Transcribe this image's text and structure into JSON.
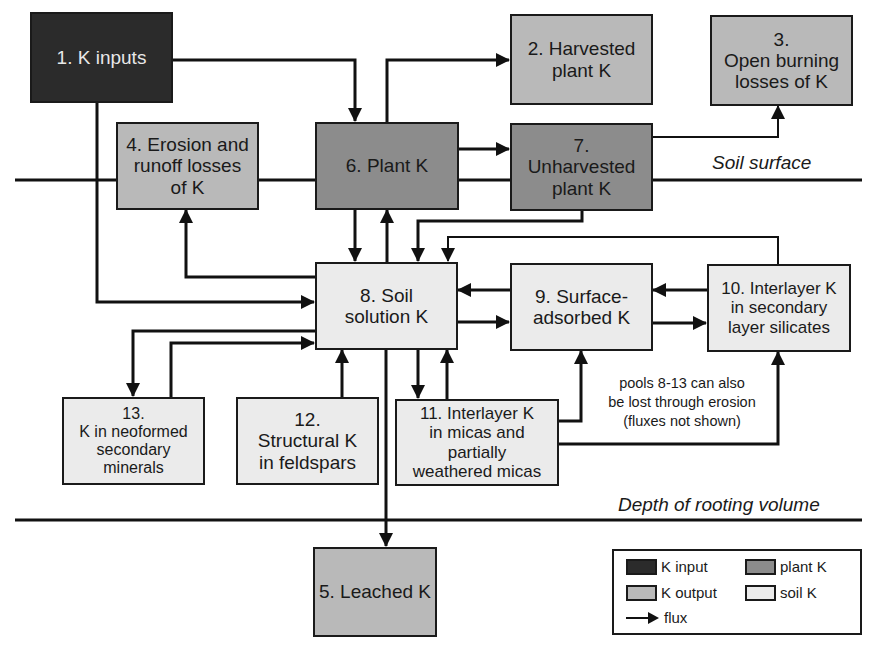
{
  "diagram": {
    "boundaries": {
      "soil_surface": "Soil surface",
      "rooting_depth": "Depth of rooting volume"
    },
    "pools": [
      {
        "id": 1,
        "label": "1. K inputs",
        "category": "K input"
      },
      {
        "id": 2,
        "label": "2. Harvested\nplant K",
        "category": "K output"
      },
      {
        "id": 3,
        "label": "3.\nOpen burning\nlosses of  K",
        "category": "K output"
      },
      {
        "id": 4,
        "label": "4. Erosion and\nrunoff losses\nof K",
        "category": "K output"
      },
      {
        "id": 5,
        "label": "5. Leached K",
        "category": "K output"
      },
      {
        "id": 6,
        "label": "6. Plant K",
        "category": "plant K"
      },
      {
        "id": 7,
        "label": "7.\nUnharvested\nplant K",
        "category": "plant K"
      },
      {
        "id": 8,
        "label": "8. Soil\nsolution K",
        "category": "soil K"
      },
      {
        "id": 9,
        "label": "9. Surface-\nadsorbed K",
        "category": "soil K"
      },
      {
        "id": 10,
        "label": "10. Interlayer K\nin secondary\nlayer silicates",
        "category": "soil K"
      },
      {
        "id": 11,
        "label": "11. Interlayer K\nin micas and\npartially\nweathered micas",
        "category": "soil K"
      },
      {
        "id": 12,
        "label": "12.\nStructural K\nin feldspars",
        "category": "soil K"
      },
      {
        "id": 13,
        "label": "13.\nK in neoformed\nsecondary\nminerals",
        "category": "soil K"
      }
    ],
    "fluxes": [
      {
        "from": 1,
        "to": 6
      },
      {
        "from": 1,
        "to": 8
      },
      {
        "from": 6,
        "to": 2
      },
      {
        "from": 6,
        "to": 7
      },
      {
        "from": 7,
        "to": 3
      },
      {
        "from": 6,
        "to": 8
      },
      {
        "from": 8,
        "to": 6
      },
      {
        "from": 7,
        "to": 8
      },
      {
        "from": 8,
        "to": 4
      },
      {
        "from": 8,
        "to": 9
      },
      {
        "from": 9,
        "to": 8
      },
      {
        "from": 9,
        "to": 10
      },
      {
        "from": 10,
        "to": 9
      },
      {
        "from": 10,
        "to": 8
      },
      {
        "from": 8,
        "to": 13
      },
      {
        "from": 13,
        "to": 8
      },
      {
        "from": 12,
        "to": 8
      },
      {
        "from": 8,
        "to": 11
      },
      {
        "from": 11,
        "to": 8
      },
      {
        "from": 11,
        "to": 9
      },
      {
        "from": 11,
        "to": 10
      },
      {
        "from": 8,
        "to": 5
      }
    ],
    "note": "pools 8-13 can also\nbe lost through erosion\n(fluxes not shown)",
    "legend": {
      "items": [
        {
          "label": "K input",
          "color": "#2b2b2b"
        },
        {
          "label": "plant K",
          "color": "#8c8c8c"
        },
        {
          "label": "K output",
          "color": "#b9b9b9"
        },
        {
          "label": "soil K",
          "color": "#ebebeb"
        }
      ],
      "flux_label": "flux"
    }
  }
}
